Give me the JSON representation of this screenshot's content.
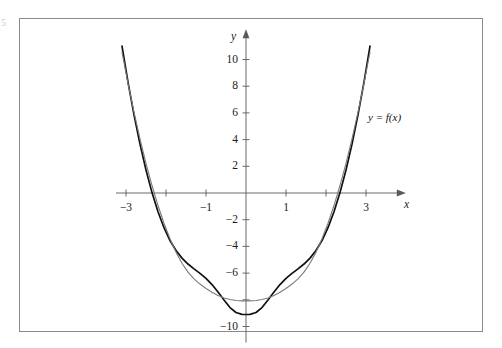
{
  "figure": {
    "margin_mark": "5",
    "frame_color": "#8a8a8a",
    "background": "#ffffff"
  },
  "axes": {
    "x_axis_label": "x",
    "y_axis_label": "y",
    "axis_color": "#5a5a5a",
    "origin_px": {
      "x": 246,
      "y": 193
    },
    "px_per_x_unit": 40.0,
    "px_per_y_unit": 13.35,
    "x_tick_values": [
      -3,
      -2,
      -1,
      1,
      2,
      3
    ],
    "x_tick_labels": [
      "−3",
      "",
      "−1",
      "1",
      "",
      "3"
    ],
    "y_tick_values": [
      10,
      8,
      6,
      4,
      2,
      -2,
      -4,
      -6,
      -8,
      -10
    ],
    "y_tick_labels": [
      "10",
      "8",
      "6",
      "4",
      "2",
      "−2",
      "−4",
      "−6",
      "",
      "−10"
    ]
  },
  "annotations": [
    {
      "id": "s2",
      "text_html": "y = S<sub>2</sub>(x)",
      "color": "#6f6f6f",
      "x_px": 302,
      "y_px": 91
    },
    {
      "id": "f",
      "text_html": "y = f(x)",
      "color": "#111111",
      "x_px": 368,
      "y_px": 112
    }
  ],
  "chart_data": {
    "type": "line",
    "title": "",
    "xlabel": "x",
    "ylabel": "y",
    "xlim": [
      -3.35,
      3.6
    ],
    "ylim": [
      -11.5,
      12.0
    ],
    "grid": false,
    "legend": "inline-labels",
    "x": [
      -3.1,
      -2.95,
      -2.8,
      -2.65,
      -2.5,
      -2.35,
      -2.2,
      -2.05,
      -1.9,
      -1.75,
      -1.6,
      -1.45,
      -1.3,
      -1.15,
      -1.0,
      -0.85,
      -0.7,
      -0.55,
      -0.4,
      -0.25,
      -0.1,
      0.0,
      0.1,
      0.25,
      0.4,
      0.55,
      0.7,
      0.85,
      1.0,
      1.15,
      1.3,
      1.45,
      1.6,
      1.75,
      1.9,
      2.05,
      2.2,
      2.35,
      2.5,
      2.65,
      2.8,
      2.95,
      3.1
    ],
    "series": [
      {
        "name": "y = f(x)",
        "color": "#111111",
        "width": 1.7,
        "values": [
          11.0,
          8.3,
          5.85,
          3.66,
          1.72,
          0.03,
          -1.41,
          -2.6,
          -3.56,
          -4.31,
          -4.88,
          -5.32,
          -5.68,
          -6.02,
          -6.4,
          -6.86,
          -7.41,
          -8.01,
          -8.58,
          -8.95,
          -9.09,
          -9.1,
          -9.09,
          -8.95,
          -8.58,
          -8.01,
          -7.41,
          -6.86,
          -6.4,
          -6.02,
          -5.68,
          -5.32,
          -4.88,
          -4.31,
          -3.56,
          -2.6,
          -1.41,
          0.03,
          1.72,
          3.66,
          5.85,
          8.3,
          11.0
        ]
      },
      {
        "name": "y = S2(x)",
        "color": "#7b7b7b",
        "width": 1.1,
        "values": [
          10.55,
          8.22,
          6.05,
          4.05,
          2.22,
          0.56,
          -0.94,
          -2.27,
          -3.43,
          -4.43,
          -5.26,
          -5.93,
          -6.43,
          -6.82,
          -7.15,
          -7.44,
          -7.68,
          -7.86,
          -7.98,
          -8.05,
          -8.08,
          -8.08,
          -8.08,
          -8.05,
          -7.98,
          -7.86,
          -7.68,
          -7.44,
          -7.15,
          -6.82,
          -6.43,
          -5.93,
          -5.26,
          -4.43,
          -3.43,
          -2.27,
          -0.94,
          0.56,
          2.22,
          4.05,
          6.05,
          8.22,
          10.55
        ]
      }
    ],
    "intersections_x": [
      -1.3,
      1.3
    ],
    "f_min": {
      "x": 0,
      "y": -9.1
    },
    "s2_min": {
      "x": 0,
      "y": -8.08
    }
  }
}
